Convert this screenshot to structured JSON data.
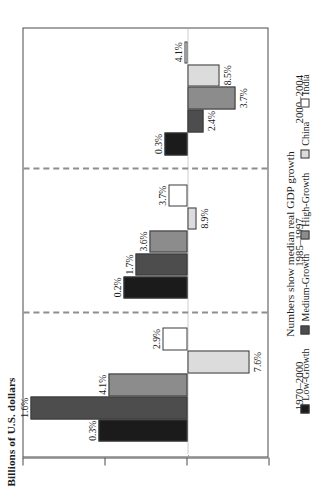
{
  "axis_title": "Billions of U.S. dollars",
  "caption": "Numbers show median real GDP growth",
  "ticks": [
    {
      "label": "1000",
      "value": 1000
    },
    {
      "label": "500",
      "value": 500
    },
    {
      "label": "0",
      "value": 0
    },
    {
      "label": "-500",
      "value": -500
    }
  ],
  "legend": [
    {
      "label": "Low-Growth",
      "color": "#1b1b1b"
    },
    {
      "label": "Medium-Growth",
      "color": "#4d4d4d"
    },
    {
      "label": "High-Growth",
      "color": "#8c8c8c"
    },
    {
      "label": "China",
      "color": "#dcdcdc"
    },
    {
      "label": "India",
      "color": "#ffffff"
    }
  ],
  "chart_data": {
    "type": "bar",
    "title": "",
    "xlabel": "",
    "ylabel": "Billions of U.S. dollars",
    "ylim": [
      -500,
      1000
    ],
    "grid": false,
    "legend_position": "bottom",
    "orientation": "vertical-grouped",
    "categories": [
      "1970–2000",
      "1985–1997",
      "2000–2004"
    ],
    "annotation": "Numbers show median real GDP growth",
    "series": [
      {
        "name": "Low-Growth",
        "color": "#1b1b1b",
        "values": [
          540,
          390,
          140
        ],
        "labels": [
          "0.3%",
          "0.2%",
          "0.3%"
        ]
      },
      {
        "name": "Medium-Growth",
        "color": "#4d4d4d",
        "values": [
          960,
          320,
          -100
        ],
        "labels": [
          "1.6%",
          "1.7%",
          "2.4%"
        ]
      },
      {
        "name": "High-Growth",
        "color": "#8c8c8c",
        "values": [
          480,
          230,
          -290
        ],
        "labels": [
          "4.1%",
          "3.6%",
          "3.7%"
        ]
      },
      {
        "name": "China",
        "color": "#dcdcdc",
        "values": [
          -380,
          -55,
          -195
        ],
        "labels": [
          "7.6%",
          "8.9%",
          "8.5%"
        ]
      },
      {
        "name": "India",
        "color": "#ffffff",
        "values": [
          150,
          115,
          20
        ],
        "labels": [
          "2.9%",
          "3.7%",
          "4.1%"
        ]
      }
    ]
  }
}
